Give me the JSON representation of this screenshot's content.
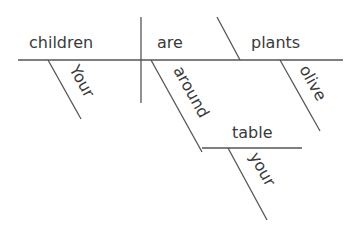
{
  "diagram": {
    "type": "sentence-diagram",
    "words": {
      "subject": "children",
      "verb": "are",
      "complement": "plants",
      "subject_modifier": "Your",
      "complement_modifier": "olive",
      "preposition": "around",
      "prepositional_object": "table",
      "object_modifier": "your"
    },
    "colors": {
      "line": "#555555",
      "text": "#3a3a3a",
      "background": "#ffffff"
    }
  }
}
